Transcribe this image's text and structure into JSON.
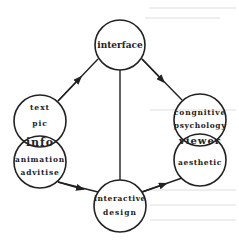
{
  "diagram": {
    "nodes": {
      "interface": {
        "label": "interface"
      },
      "info": {
        "upper_lines": [
          "text",
          "pic"
        ],
        "overlap_label": "info",
        "lower_lines": [
          "animation",
          "advitise"
        ]
      },
      "viewer": {
        "upper_lines": [
          "congnitive",
          "psychology"
        ],
        "overlap_label": "viewer",
        "lower_lines": [
          "aesthetic"
        ]
      },
      "interactive_design": {
        "lines": [
          "interactive",
          "design"
        ]
      }
    },
    "edges": [
      {
        "from": "info",
        "to": "interface",
        "directed": true
      },
      {
        "from": "interface",
        "to": "viewer",
        "directed": true
      },
      {
        "from": "info",
        "to": "interactive_design",
        "directed": true
      },
      {
        "from": "interactive_design",
        "to": "viewer",
        "directed": true
      },
      {
        "from": "interface",
        "to": "interactive_design",
        "directed": false
      }
    ],
    "colors": {
      "stroke": "#222222",
      "text": "#222222",
      "background": "#ffffff"
    }
  }
}
